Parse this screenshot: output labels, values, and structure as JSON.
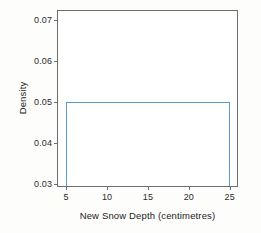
{
  "chart_data": {
    "type": "line",
    "title": "",
    "subtitle": "",
    "xlabel": "New Snow Depth (centimetres)",
    "ylabel": "Density",
    "xlim": [
      4.0,
      25.9
    ],
    "ylim": [
      0.0295,
      0.0723
    ],
    "xticks": [
      5,
      10,
      15,
      20,
      25
    ],
    "xtick_labels": [
      "5",
      "10",
      "15",
      "20",
      "25"
    ],
    "yticks": [
      0.03,
      0.04,
      0.05,
      0.06,
      0.07
    ],
    "ytick_labels": [
      "0.03",
      "0.04",
      "0.05",
      "0.06",
      "0.07"
    ],
    "grid": false,
    "legend": null,
    "annotations": [],
    "series": [
      {
        "name": "Uniform density",
        "color": "#5b9bd5",
        "x": [
          5,
          5,
          25,
          25
        ],
        "y": [
          0.03,
          0.05,
          0.05,
          0.03
        ],
        "description": "Uniform(5,25) probability density: constant height 0.05 between x=5 and x=25, with vertical edges dropping to the axis baseline."
      }
    ],
    "distribution": {
      "family": "uniform",
      "min": 5,
      "max": 25,
      "density": 0.05
    }
  },
  "style": {
    "line_color": "#5b9bd5",
    "frame_color": "#6e6e6e",
    "text_color": "#222222",
    "background": "#ffffff"
  }
}
